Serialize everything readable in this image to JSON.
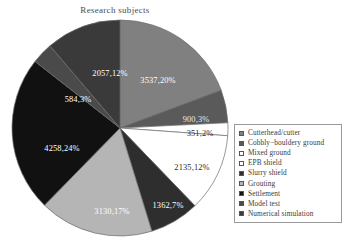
{
  "chart_data": {
    "type": "pie",
    "title": "Research subjects",
    "xlabel": "",
    "ylabel": "",
    "legend_position": "right",
    "grid": false,
    "total": 18324,
    "categories": [
      "Cutterhead/cutter",
      "Cobbly-bouldery ground",
      "Mixed ground",
      "EPB shield",
      "Slurry shield",
      "Grouting",
      "Settlement",
      "Model test",
      "Numerical simulation"
    ],
    "values": [
      3537,
      900,
      351,
      2135,
      1362,
      3130,
      4258,
      584,
      2057
    ],
    "percents": [
      20,
      3,
      2,
      12,
      7,
      17,
      24,
      3,
      12
    ],
    "colors": [
      "#808080",
      "#5a5a5a",
      "#ffffff",
      "#ffffff",
      "#2e2e2e",
      "#b5b5b5",
      "#111111",
      "#4a4a4a",
      "#3a3a3a"
    ],
    "slices": [
      {
        "label": "3537,20%",
        "value": 3537,
        "percent": 20,
        "color": "#808080",
        "text_color": "#ffffff",
        "lx": 148,
        "ly": 65
      },
      {
        "label": "900,3%",
        "value": 900,
        "percent": 3,
        "color": "#5a5a5a",
        "text_color": "#e8e8e8",
        "lx": 186,
        "ly": 104
      },
      {
        "label": "351,2%",
        "value": 351,
        "percent": 2,
        "color": "#ffffff",
        "text_color": "#2a2a2a",
        "lx": 190,
        "ly": 118
      },
      {
        "label": "2135,12%",
        "value": 2135,
        "percent": 12,
        "color": "#ffffff",
        "text_color": "#2a2a2a",
        "lx": 182,
        "ly": 152
      },
      {
        "label": "1362,7%",
        "value": 1362,
        "percent": 7,
        "color": "#2e2e2e",
        "text_color": "#ffffff",
        "lx": 158,
        "ly": 190
      },
      {
        "label": "3130,17%",
        "value": 3130,
        "percent": 17,
        "color": "#b5b5b5",
        "text_color": "#ffffff",
        "lx": 102,
        "ly": 196
      },
      {
        "label": "4258,24%",
        "value": 4258,
        "percent": 24,
        "color": "#111111",
        "text_color": "#ffffff",
        "lx": 52,
        "ly": 133
      },
      {
        "label": "584,3%",
        "value": 584,
        "percent": 3,
        "color": "#4a4a4a",
        "text_color": "#ffffff",
        "lx": 68,
        "ly": 84
      },
      {
        "label": "2057,12%",
        "value": 2057,
        "percent": 12,
        "color": "#3a3a3a",
        "text_color": "#ffffff",
        "lx": 100,
        "ly": 58
      }
    ]
  },
  "legend": {
    "items": [
      {
        "label": "Cutterhead/cutter",
        "color": "#808080"
      },
      {
        "label": "Cobbly−bouldery ground",
        "color": "#5a5a5a"
      },
      {
        "label": "Mixed ground",
        "color": "#ffffff"
      },
      {
        "label": "EPB shield",
        "color": "#ffffff"
      },
      {
        "label": "Slurry shield",
        "color": "#2e2e2e"
      },
      {
        "label": "Grouting",
        "color": "#b5b5b5"
      },
      {
        "label": "Settlement",
        "color": "#111111"
      },
      {
        "label": "Model test",
        "color": "#4a4a4a"
      },
      {
        "label": "Numerical simulation",
        "color": "#3a3a3a"
      }
    ]
  }
}
